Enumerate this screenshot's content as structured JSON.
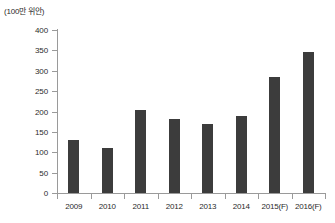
{
  "chart_data": {
    "type": "bar",
    "title": "",
    "subtitle": "",
    "unit_label": "(100만 위안)",
    "xlabel": "",
    "ylabel": "",
    "ylim": [
      0,
      400
    ],
    "ytick_step": 50,
    "yticks": [
      "400",
      "350",
      "300",
      "250",
      "200",
      "150",
      "100",
      "50",
      "0"
    ],
    "ytick_values": [
      400,
      350,
      300,
      250,
      200,
      150,
      100,
      50,
      0
    ],
    "grid": false,
    "legend": null,
    "bar_color": "#3c3c3c",
    "axis_color": "#9a9a9a",
    "text_color": "#2b2b2b",
    "categories": [
      "2009",
      "2010",
      "2011",
      "2012",
      "2013",
      "2014",
      "2015(F)",
      "2016(F)"
    ],
    "values": [
      130,
      111,
      204,
      181,
      169,
      189,
      284,
      345
    ],
    "series": [
      {
        "name": "",
        "values": [
          130,
          111,
          204,
          181,
          169,
          189,
          284,
          345
        ]
      }
    ]
  }
}
